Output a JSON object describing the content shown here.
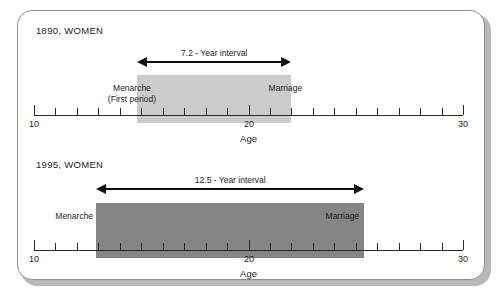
{
  "figure": {
    "background_color": "#ffffff",
    "frame_border_color": "#8e8e8e"
  },
  "axis": {
    "min": 10,
    "max": 30,
    "tick_step": 1,
    "labeled_ticks": [
      "10",
      "20",
      "30"
    ],
    "labeled_tick_values": [
      10,
      20,
      30
    ],
    "title": "Age"
  },
  "panels": [
    {
      "title": "1890, WOMEN",
      "bar_color": "#cbcbcb",
      "start_label": "Menarche",
      "start_sublabel": "(First period)",
      "end_label": "Marriage",
      "interval_label": "7.2 - Year interval"
    },
    {
      "title": "1995, WOMEN",
      "bar_color": "#858585",
      "start_label": "Menarche",
      "start_sublabel": "",
      "end_label": "Marriage",
      "interval_label": "12.5 - Year interval"
    }
  ],
  "chart_data": {
    "type": "bar",
    "orientation": "horizontal",
    "title": "",
    "xlabel": "Age",
    "ylabel": "",
    "xlim": [
      10,
      30
    ],
    "grid": false,
    "legend": "none",
    "tick_labels": [
      "10",
      "20",
      "30"
    ],
    "tick_step": 1,
    "series": [
      {
        "name": "1890, WOMEN",
        "start": 14.8,
        "end": 22.0,
        "interval": 7.2,
        "interval_label": "7.2 - Year interval",
        "start_label": "Menarche (First period)",
        "end_label": "Marriage",
        "color": "#cbcbcb"
      },
      {
        "name": "1995, WOMEN",
        "start": 12.9,
        "end": 25.4,
        "interval": 12.5,
        "interval_label": "12.5 - Year interval",
        "start_label": "Menarche",
        "end_label": "Marriage",
        "color": "#858585"
      }
    ]
  }
}
